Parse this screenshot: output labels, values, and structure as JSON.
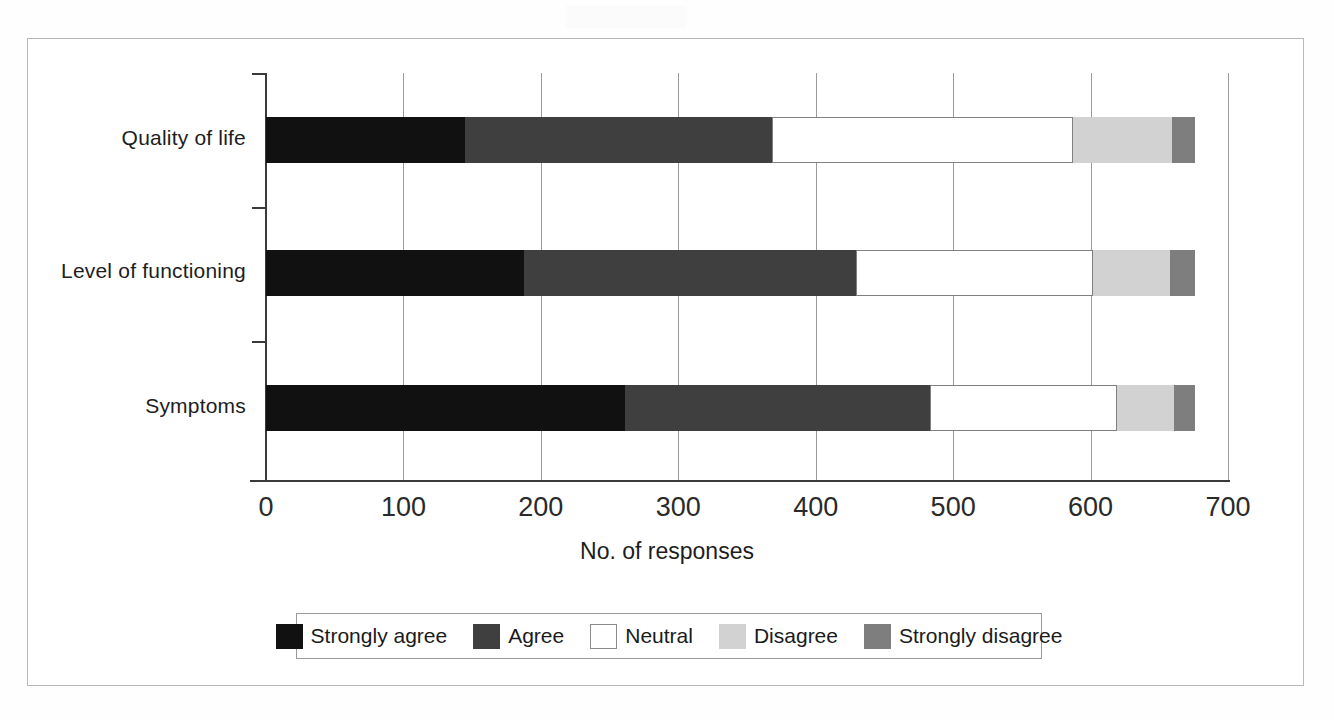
{
  "chart_data": {
    "type": "bar",
    "orientation": "horizontal",
    "stacked": true,
    "title": "",
    "xlabel": "No. of responses",
    "ylabel": "",
    "xlim": [
      0,
      700
    ],
    "xticks": [
      0,
      100,
      200,
      300,
      400,
      500,
      600,
      700
    ],
    "grid": "vertical",
    "legend_position": "bottom",
    "categories": [
      "Quality of life",
      "Level of functioning",
      "Symptoms"
    ],
    "series": [
      {
        "name": "Strongly agree",
        "color": "#111111",
        "values": [
          145,
          188,
          261
        ]
      },
      {
        "name": "Agree",
        "color": "#3f3f3f",
        "values": [
          223,
          241,
          222
        ]
      },
      {
        "name": "Neutral",
        "color": "#ffffff",
        "values": [
          219,
          173,
          136
        ]
      },
      {
        "name": "Disagree",
        "color": "#d2d2d2",
        "values": [
          72,
          56,
          42
        ]
      },
      {
        "name": "Strongly disagree",
        "color": "#7e7e7e",
        "values": [
          17,
          18,
          15
        ]
      }
    ],
    "cumulative_boundaries": {
      "Quality of life": [
        145,
        368,
        587,
        659,
        676
      ],
      "Level of functioning": [
        188,
        429,
        602,
        658,
        676
      ],
      "Symptoms": [
        261,
        483,
        619,
        661,
        676
      ]
    },
    "totals": [
      676,
      676,
      676
    ]
  },
  "axis": {
    "x_title": "No. of responses",
    "x_tick_labels": [
      "0",
      "100",
      "200",
      "300",
      "400",
      "500",
      "600",
      "700"
    ],
    "y_tick_labels": [
      "Quality of life",
      "Level of functioning",
      "Symptoms"
    ]
  },
  "legend": {
    "items": [
      {
        "label": "Strongly agree",
        "swatch": "strongly-agree"
      },
      {
        "label": "Agree",
        "swatch": "agree"
      },
      {
        "label": "Neutral",
        "swatch": "neutral"
      },
      {
        "label": "Disagree",
        "swatch": "disagree"
      },
      {
        "label": "Strongly disagree",
        "swatch": "strongly-disagree"
      }
    ]
  }
}
